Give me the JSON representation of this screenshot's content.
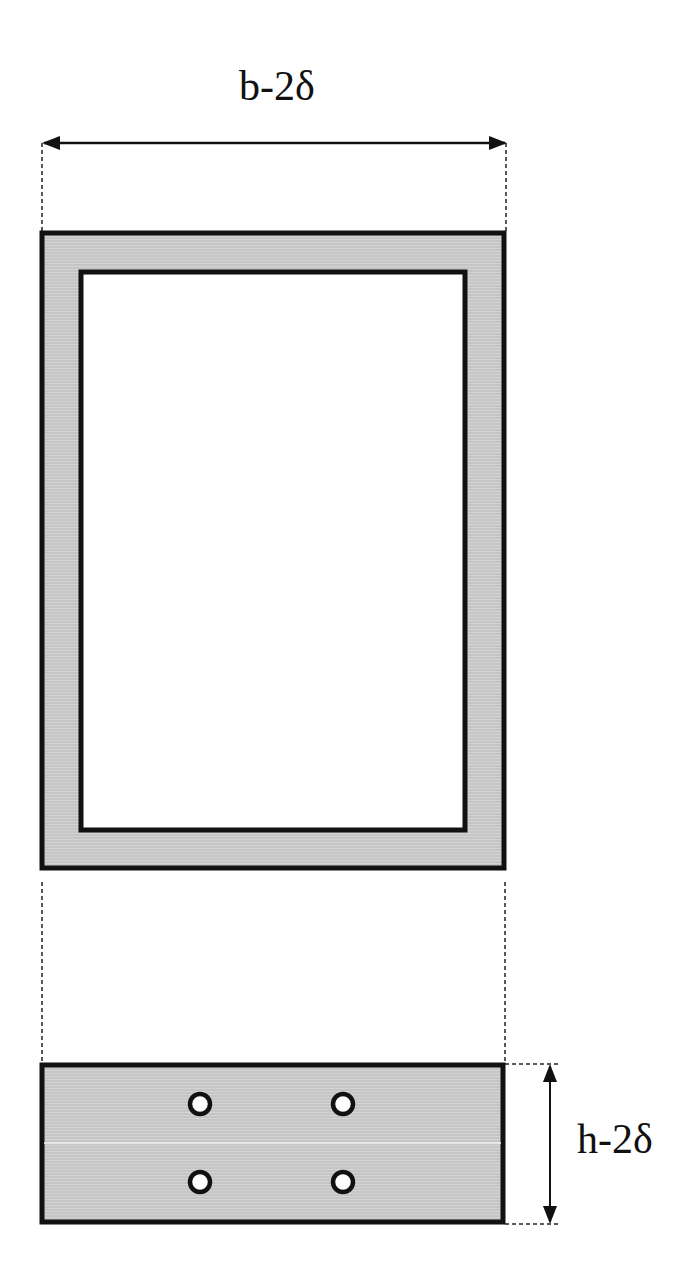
{
  "diagram": {
    "type": "cross-section-dimension-drawing",
    "colors": {
      "stroke": "#111111",
      "fill_hatch": "#c9c9c9",
      "fill_light": "#d8d8d8",
      "background": "#ffffff",
      "hole_fill": "#ffffff"
    },
    "top_dimension": {
      "label": "b-2δ",
      "arrow": {
        "x1": 42,
        "x2": 507,
        "y": 143
      },
      "text_position": {
        "x": 277,
        "y": 100
      }
    },
    "side_dimension": {
      "label": "h-2δ",
      "arrow": {
        "x": 550,
        "y1": 1064,
        "y2": 1224
      },
      "text_position": {
        "x": 615,
        "y": 1153
      }
    },
    "hollow_section": {
      "outer": {
        "x": 40,
        "y": 231,
        "width": 466,
        "height": 639
      },
      "inner": {
        "x": 79,
        "y": 270,
        "width": 388,
        "height": 562
      }
    },
    "solid_section": {
      "rect": {
        "x": 40,
        "y": 1063,
        "width": 465,
        "height": 161
      },
      "holes": [
        {
          "cx": 200,
          "cy": 1104,
          "r": 10
        },
        {
          "cx": 343,
          "cy": 1104,
          "r": 10
        },
        {
          "cx": 200,
          "cy": 1182,
          "r": 10
        },
        {
          "cx": 343,
          "cy": 1182,
          "r": 10
        }
      ]
    }
  }
}
